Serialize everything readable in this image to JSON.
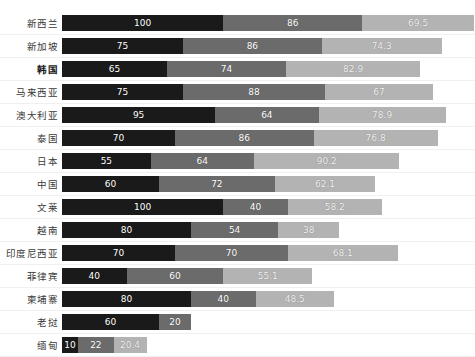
{
  "chart_title": "",
  "colors": {
    "series1": "#1a1a1a",
    "series2": "#6b6b6b",
    "series3": "#b3b3b3",
    "background": "#ffffff",
    "label_text": "#3a3a3a",
    "value_text": "#ffffff"
  },
  "chart_data": {
    "type": "bar",
    "orientation": "horizontal",
    "stacked": true,
    "title": "",
    "xlabel": "",
    "ylabel": "",
    "grid": false,
    "legend_position": "none",
    "xlim": [
      0,
      256
    ],
    "categories": [
      "新西兰",
      "新加坡",
      "韩国",
      "马来西亚",
      "澳大利亚",
      "泰国",
      "日本",
      "中国",
      "文莱",
      "越南",
      "印度尼西亚",
      "菲律宾",
      "柬埔寨",
      "老挝",
      "缅甸"
    ],
    "series": [
      {
        "name": "series-1",
        "color": "#1a1a1a",
        "values": [
          100,
          75,
          65,
          75,
          95,
          70,
          55,
          60,
          100,
          80,
          70,
          40,
          80,
          60,
          10
        ]
      },
      {
        "name": "series-2",
        "color": "#6b6b6b",
        "values": [
          86,
          86,
          74,
          88,
          64,
          86,
          64,
          72,
          40,
          54,
          70,
          60,
          40,
          20,
          22
        ]
      },
      {
        "name": "series-3",
        "color": "#b3b3b3",
        "values": [
          69.5,
          74.3,
          82.9,
          67,
          78.9,
          76.8,
          90.2,
          62.1,
          58.2,
          38,
          68.1,
          55.1,
          48.5,
          null,
          20.4
        ]
      }
    ],
    "value_labels": [
      [
        "100",
        "86",
        "69.5"
      ],
      [
        "75",
        "86",
        "74.3"
      ],
      [
        "65",
        "74",
        "82.9"
      ],
      [
        "75",
        "88",
        "67"
      ],
      [
        "95",
        "64",
        "78.9"
      ],
      [
        "70",
        "86",
        "76.8"
      ],
      [
        "55",
        "64",
        "90.2"
      ],
      [
        "60",
        "72",
        "62.1"
      ],
      [
        "100",
        "40",
        "58.2"
      ],
      [
        "80",
        "54",
        "38"
      ],
      [
        "70",
        "70",
        "68.1"
      ],
      [
        "40",
        "60",
        "55.1"
      ],
      [
        "80",
        "40",
        "48.5"
      ],
      [
        "60",
        "20",
        ""
      ],
      [
        "10",
        "22",
        "20.4"
      ]
    ],
    "emphasized_categories": [
      "韩国"
    ]
  }
}
